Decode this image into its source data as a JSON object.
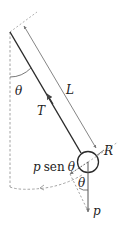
{
  "diagram": {
    "type": "physical-pendulum",
    "labels": {
      "theta_top": "θ",
      "length": "L",
      "tension": "T",
      "radius": "R",
      "weight_component_p": "p",
      "weight_component_sen": "sen",
      "weight_component_theta": "θ",
      "theta_bottom": "θ",
      "weight": "p"
    },
    "colors": {
      "rod": "#2a2a2a",
      "dimension_line": "#666666",
      "dashed": "#8a8a8a",
      "text": "#222222"
    }
  }
}
